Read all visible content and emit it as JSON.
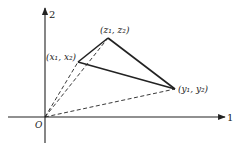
{
  "diagram": {
    "axes": {
      "horizontal_label": "1",
      "vertical_label": "2",
      "origin_label": "O"
    },
    "points": [
      {
        "id": "x",
        "label": "(x₁, x₂)",
        "x": 78,
        "y": 62
      },
      {
        "id": "z",
        "label": "(z₁, z₂)",
        "x": 108,
        "y": 38
      },
      {
        "id": "y",
        "label": "(y₁, y₂)",
        "x": 175,
        "y": 89
      }
    ],
    "solid_edges": [
      [
        "x",
        "z"
      ],
      [
        "z",
        "y"
      ],
      [
        "x",
        "y"
      ]
    ],
    "dashed_edges": [
      [
        "O",
        "x"
      ],
      [
        "O",
        "z"
      ],
      [
        "O",
        "y"
      ]
    ],
    "colors": {
      "ink": "#222222",
      "background": "#ffffff"
    }
  }
}
